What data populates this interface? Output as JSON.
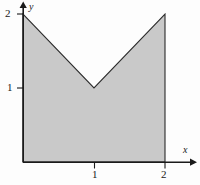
{
  "figure": {
    "title": "",
    "background_color": "#fdfdfd"
  },
  "axes": {
    "x_axis_name": "x",
    "y_axis_name": "y",
    "x_ticks": [
      {
        "value": 1,
        "label": "1"
      },
      {
        "value": 2,
        "label": "2"
      }
    ],
    "y_ticks": [
      {
        "value": 1,
        "label": "1"
      },
      {
        "value": 2,
        "label": "2"
      }
    ],
    "origin_px": {
      "x": 23,
      "y": 162
    },
    "unit_px": {
      "x": 71,
      "y": 74
    },
    "x_arrow_tip_px": {
      "x": 196,
      "y": 162
    },
    "y_arrow_tip_px": {
      "x": 23,
      "y": 2
    },
    "axis_color": "#1a1a1a"
  },
  "chart_data": {
    "type": "area",
    "title": "",
    "xlabel": "x",
    "ylabel": "y",
    "xlim": [
      0,
      2.45
    ],
    "ylim": [
      0,
      2.18
    ],
    "grid": false,
    "legend": null,
    "region": {
      "name": "shaded-region",
      "fill_color": "#c9c9c9",
      "stroke_color": "#2b2b2b",
      "description": "Region bounded below by the x-axis on 0 <= x <= 2, on the left by the y-axis, on the right by the line x = 2, and above by the V-shaped curve y = 1 + |x - 1|.",
      "vertices": [
        {
          "x": 0,
          "y": 0
        },
        {
          "x": 0,
          "y": 2
        },
        {
          "x": 1,
          "y": 1
        },
        {
          "x": 2,
          "y": 2
        },
        {
          "x": 2,
          "y": 0
        }
      ]
    },
    "boundary_curve": {
      "name": "upper-boundary",
      "equation": "y = 1 + |x - 1|",
      "points": [
        {
          "x": 0,
          "y": 2
        },
        {
          "x": 1,
          "y": 1
        },
        {
          "x": 2,
          "y": 2
        }
      ]
    }
  }
}
